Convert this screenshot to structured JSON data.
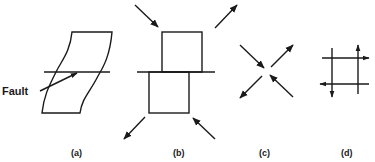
{
  "figure": {
    "background": "#ffffff",
    "ink_color": "#1a1a1a",
    "panels": [
      {
        "id": "a",
        "caption": "(a)",
        "annotation": "Fault",
        "description": "Sheared block with a horizontal fault line; curved sides"
      },
      {
        "id": "b",
        "caption": "(b)",
        "description": "Two offset squares along horizontal fault with four diagonal stress arrows"
      },
      {
        "id": "c",
        "caption": "(c)",
        "description": "Four diagonal arrows around a point: two inward (compression), two outward (tension)"
      },
      {
        "id": "d",
        "caption": "(d)",
        "description": "Square grid of two vertical and two horizontal lines with shear arrows at ends"
      }
    ]
  }
}
